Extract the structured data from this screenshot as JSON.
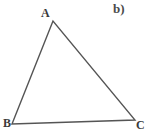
{
  "figure": {
    "part_label": "b)",
    "background_color": "#ffffff",
    "stroke_color": "#555555",
    "stroke_width": 1.4,
    "width": 149,
    "height": 140,
    "vertices": [
      {
        "name": "A",
        "label": "A",
        "x": 53,
        "y": 21
      },
      {
        "name": "B",
        "label": "B",
        "x": 12,
        "y": 124
      },
      {
        "name": "C",
        "label": "C",
        "x": 135,
        "y": 120
      }
    ],
    "edges": [
      {
        "name": "edge-AB",
        "from": "A",
        "to": "B"
      },
      {
        "name": "edge-BC",
        "from": "B",
        "to": "C"
      },
      {
        "name": "edge-AC",
        "from": "A",
        "to": "C"
      }
    ],
    "labels": {
      "A": "A",
      "B": "B",
      "C": "C"
    }
  }
}
